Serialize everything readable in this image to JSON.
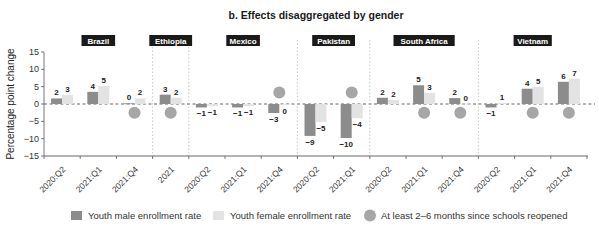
{
  "chart_data": {
    "type": "bar",
    "title": "b. Effects disaggregated by gender",
    "xlabel": "",
    "ylabel": "Percentage point change",
    "ylim": [
      -15,
      15
    ],
    "yticks": [
      15,
      10,
      5,
      0,
      -5,
      -10,
      -15
    ],
    "ytick_labels": [
      "15",
      "10",
      "5",
      "0",
      "−5",
      "−10",
      "−15"
    ],
    "grid": false,
    "legend_position": "bottom",
    "groups": [
      {
        "country": "Brazil",
        "periods": [
          "2020:Q2",
          "2021:Q1",
          "2021:Q4"
        ]
      },
      {
        "country": "Ethiopia",
        "periods": [
          "2021"
        ]
      },
      {
        "country": "Mexico",
        "periods": [
          "2020:Q2",
          "2021:Q1",
          "2021:Q4"
        ]
      },
      {
        "country": "Pakistan",
        "periods": [
          "2020:Q2",
          "2021:Q1"
        ]
      },
      {
        "country": "South Africa",
        "periods": [
          "2020:Q2",
          "2021:Q1",
          "2021:Q4"
        ]
      },
      {
        "country": "Vietnam",
        "periods": [
          "2020:Q2",
          "2021:Q1",
          "2021:Q4"
        ]
      }
    ],
    "categories": [
      "Brazil 2020:Q2",
      "Brazil 2021:Q1",
      "Brazil 2021:Q4",
      "Ethiopia 2021",
      "Mexico 2020:Q2",
      "Mexico 2021:Q1",
      "Mexico 2021:Q4",
      "Pakistan 2020:Q2",
      "Pakistan 2021:Q1",
      "South Africa 2020:Q2",
      "South Africa 2021:Q1",
      "South Africa 2021:Q4",
      "Vietnam 2020:Q2",
      "Vietnam 2021:Q1",
      "Vietnam 2021:Q4"
    ],
    "series": [
      {
        "name": "Youth male enrollment rate",
        "color": "#8c8c8c",
        "values": [
          1.6,
          3.5,
          0.2,
          2.7,
          -1.0,
          -1.0,
          -2.6,
          -9.2,
          -9.8,
          1.8,
          5.4,
          1.7,
          -1.0,
          4.4,
          6.4
        ],
        "labels": [
          "2",
          "4",
          "0",
          "3",
          "−1",
          "−1",
          "−3",
          "−9",
          "−10",
          "2",
          "5",
          "2",
          "−1",
          "4",
          "6"
        ]
      },
      {
        "name": "Youth female enrollment rate",
        "color": "#e3e3e3",
        "values": [
          2.6,
          5.2,
          1.6,
          1.8,
          -0.6,
          -0.6,
          -0.2,
          -5.2,
          -4.1,
          1.2,
          3.2,
          0.1,
          0.3,
          4.9,
          7.3
        ],
        "labels": [
          "3",
          "5",
          "2",
          "2",
          "−1",
          "−1",
          "0",
          "−5",
          "−4",
          "2",
          "3",
          "0",
          "1",
          "5",
          "7"
        ]
      }
    ],
    "markers": {
      "name": "At least 2–6 months since schools reopened",
      "color": "#a6a6a6",
      "points": [
        {
          "category": "Brazil 2021:Q4",
          "y": -2.5
        },
        {
          "category": "Ethiopia 2021",
          "y": -2.5
        },
        {
          "category": "Mexico 2021:Q4",
          "y": 3.3
        },
        {
          "category": "Pakistan 2021:Q1",
          "y": 3.3
        },
        {
          "category": "South Africa 2021:Q1",
          "y": -2.5
        },
        {
          "category": "South Africa 2021:Q4",
          "y": -2.5
        },
        {
          "category": "Vietnam 2021:Q1",
          "y": -2.5
        },
        {
          "category": "Vietnam 2021:Q4",
          "y": -2.5
        }
      ]
    }
  },
  "legend": {
    "male": "Youth male enrollment rate",
    "female": "Youth female enrollment rate",
    "reopened": "At least 2–6 months since schools reopened"
  }
}
